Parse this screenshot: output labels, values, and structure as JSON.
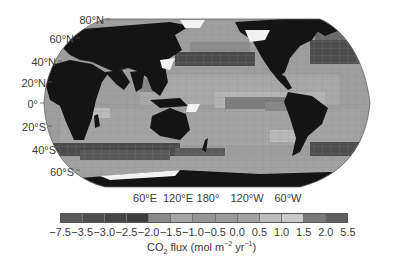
{
  "chart_data": {
    "type": "heatmap",
    "title": "",
    "subtitle": "",
    "lat_labels": [
      "80°N",
      "60°N",
      "40°N",
      "20°N",
      "0°",
      "20°S",
      "40°S",
      "60°S"
    ],
    "lon_labels": [
      "60°E",
      "120°E",
      "180°",
      "120°W",
      "60°W"
    ],
    "colorbar": {
      "label": "CO2 flux (mol m-2 yr-1)",
      "tick_labels": [
        "−7.5",
        "−3.5",
        "−3.0",
        "−2.5",
        "−2.0",
        "−1.5",
        "−1.0",
        "−0.5",
        "0.0",
        "0.5",
        "1.0",
        "1.5",
        "2.0",
        "5.5"
      ],
      "bins": [
        {
          "range": [
            -7.5,
            -3.5
          ],
          "color": "#5a5a5a"
        },
        {
          "range": [
            -3.5,
            -3.0
          ],
          "color": "#4e4e4e"
        },
        {
          "range": [
            -3.0,
            -2.5
          ],
          "color": "#464646"
        },
        {
          "range": [
            -2.5,
            -2.0
          ],
          "color": "#3e3e3e"
        },
        {
          "range": [
            -2.0,
            -1.5
          ],
          "color": "#8a8a8a"
        },
        {
          "range": [
            -1.5,
            -1.0
          ],
          "color": "#a6a6a6"
        },
        {
          "range": [
            -1.0,
            -0.5
          ],
          "color": "#969696"
        },
        {
          "range": [
            -0.5,
            0.0
          ],
          "color": "#9c9c9c"
        },
        {
          "range": [
            0.0,
            0.5
          ],
          "color": "#a2a2a2"
        },
        {
          "range": [
            0.5,
            1.0
          ],
          "color": "#bdbdbd"
        },
        {
          "range": [
            1.0,
            1.5
          ],
          "color": "#cacaca"
        },
        {
          "range": [
            1.5,
            2.0
          ],
          "color": "#7a7a7a"
        },
        {
          "range": [
            2.0,
            5.5
          ],
          "color": "#606060"
        }
      ]
    },
    "regions": [
      {
        "name": "North Pacific 40°N band",
        "flux_class": "strong uptake (-2.5 to -2.0)"
      },
      {
        "name": "North Atlantic",
        "flux_class": "strong uptake (-3.0 to -2.0)"
      },
      {
        "name": "Southern Ocean 40–50°S band",
        "flux_class": "strong uptake (-3.5 to -2.0)"
      },
      {
        "name": "Equatorial Pacific",
        "flux_class": "outgassing (1.5 to 5.5)"
      },
      {
        "name": "Subtropical gyres",
        "flux_class": "near neutral (-1.0 to 0.5)"
      }
    ],
    "legend_position": "bottom",
    "grid": true
  },
  "labels": {
    "lat": {
      "n80": "80°N",
      "n60": "60°N",
      "n40": "40°N",
      "n20": "20°N",
      "eq": "0°",
      "s20": "20°S",
      "s40": "40°S",
      "s60": "60°S"
    },
    "lon": {
      "e60": "60°E",
      "e120": "120°E",
      "d180": "180°",
      "w120": "120°W",
      "w60": "60°W"
    },
    "ticks": [
      "−7.5",
      "−3.5",
      "−3.0",
      "−2.5",
      "−2.0",
      "−1.5",
      "−1.0",
      "−0.5",
      "0.0",
      "0.5",
      "1.0",
      "1.5",
      "2.0",
      "5.5"
    ],
    "cbar_title_main": "CO",
    "cbar_title_sub": "2",
    "cbar_title_rest": " flux (mol m",
    "cbar_title_sup1": "−2",
    "cbar_title_mid": " yr",
    "cbar_title_sup2": "−1",
    "cbar_title_end": ")"
  }
}
